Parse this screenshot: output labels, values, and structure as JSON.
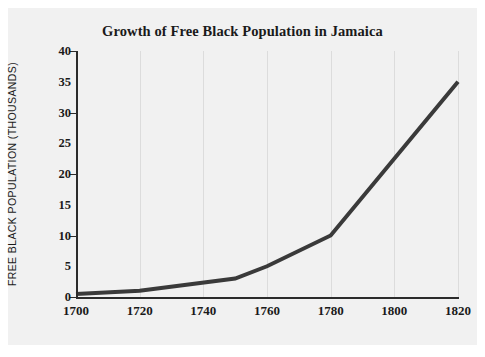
{
  "figure": {
    "background_color": "#f1f1f1",
    "page_color": "#ffffff"
  },
  "chart_data": {
    "type": "line",
    "title": "Growth of Free Black Population in Jamaica",
    "xlabel": "",
    "ylabel": "FREE BLACK POPULATION (THOUSANDS)",
    "x": [
      1700,
      1720,
      1750,
      1760,
      1780,
      1820
    ],
    "values": [
      0.5,
      1,
      3,
      5,
      10,
      35
    ],
    "series": [
      {
        "name": "Free Black Population",
        "x": [
          1700,
          1720,
          1750,
          1760,
          1780,
          1820
        ],
        "values": [
          0.5,
          1,
          3,
          5,
          10,
          35
        ],
        "color": "#3a3a3a",
        "line_width": 4
      }
    ],
    "xlim": [
      1700,
      1820
    ],
    "ylim": [
      0,
      40
    ],
    "xticks": [
      1700,
      1720,
      1740,
      1760,
      1780,
      1800,
      1820
    ],
    "yticks": [
      0,
      5,
      10,
      15,
      20,
      25,
      30,
      35,
      40
    ],
    "xtick_labels": [
      "1700",
      "1720",
      "1740",
      "1760",
      "1780",
      "1800",
      "1820"
    ],
    "ytick_labels": [
      "0",
      "5",
      "10",
      "15",
      "20",
      "25",
      "30",
      "35",
      "40"
    ],
    "grid": "vertical",
    "grid_color": "#dcdcdc",
    "legend": null,
    "legend_position": "none",
    "annotations": []
  }
}
